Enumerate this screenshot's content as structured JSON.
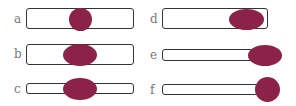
{
  "colors": {
    "blob": "#8a2347",
    "outline": "#333333",
    "label": "#777777"
  },
  "panels": [
    {
      "label": "a",
      "bar": {
        "x": 26,
        "y": 8,
        "w": 108,
        "h": 21
      },
      "blob": {
        "x": 69,
        "y": 8,
        "w": 23,
        "h": 23
      }
    },
    {
      "label": "b",
      "bar": {
        "x": 26,
        "y": 44,
        "w": 108,
        "h": 21
      },
      "blob": {
        "x": 63,
        "y": 44,
        "w": 34,
        "h": 22
      }
    },
    {
      "label": "c",
      "bar": {
        "x": 26,
        "y": 83,
        "w": 108,
        "h": 11
      },
      "blob": {
        "x": 63,
        "y": 78,
        "w": 34,
        "h": 22
      }
    },
    {
      "label": "d",
      "bar": {
        "x": 162,
        "y": 8,
        "w": 106,
        "h": 21
      },
      "blob": {
        "x": 229,
        "y": 9,
        "w": 35,
        "h": 21
      }
    },
    {
      "label": "e",
      "bar": {
        "x": 162,
        "y": 49,
        "w": 92,
        "h": 12
      },
      "blob": {
        "x": 248,
        "y": 45,
        "w": 34,
        "h": 21
      }
    },
    {
      "label": "f",
      "bar": {
        "x": 162,
        "y": 84,
        "w": 96,
        "h": 11
      },
      "blob": {
        "x": 255,
        "y": 77,
        "w": 25,
        "h": 25
      }
    }
  ],
  "label_positions": [
    {
      "x": 14,
      "y": 13
    },
    {
      "x": 14,
      "y": 48
    },
    {
      "x": 14,
      "y": 83
    },
    {
      "x": 150,
      "y": 13
    },
    {
      "x": 150,
      "y": 49
    },
    {
      "x": 150,
      "y": 84
    }
  ]
}
